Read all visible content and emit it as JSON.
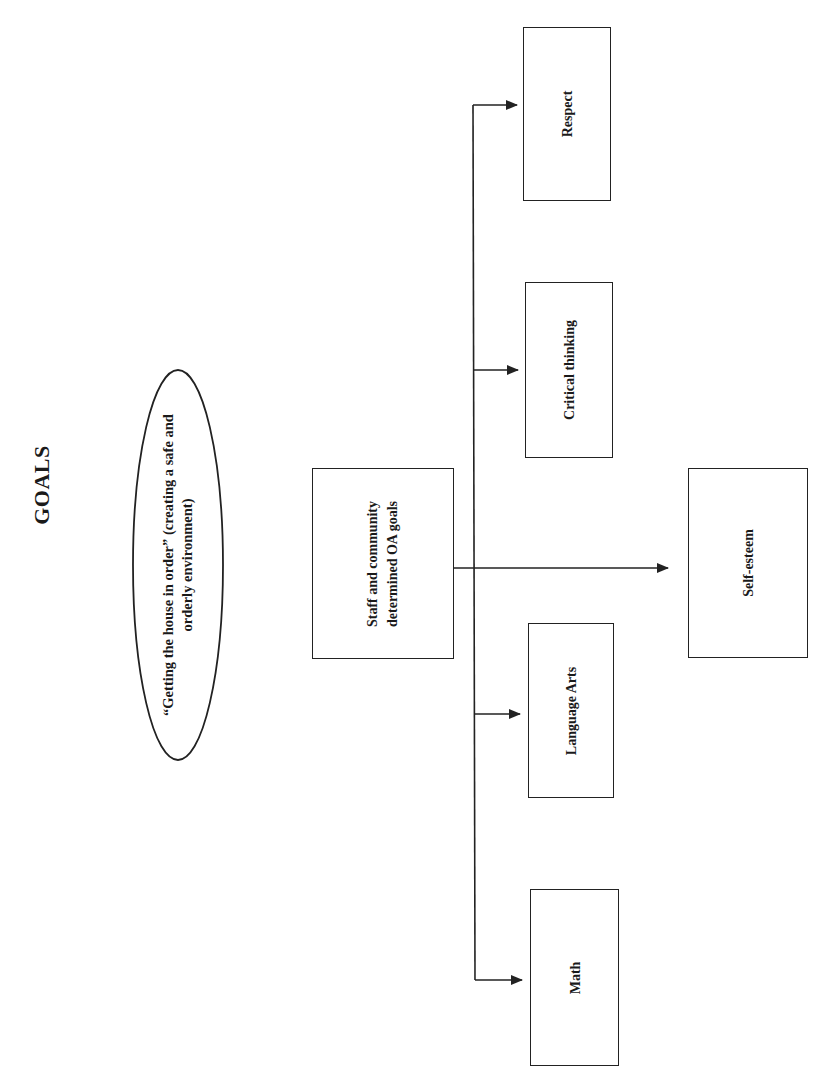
{
  "title": "GOALS",
  "ellipse": {
    "text": "“Getting the house in order” (creating a safe and orderly environment)"
  },
  "central_box": {
    "text": "Staff and community determined OA goals"
  },
  "goals": [
    {
      "id": "respect",
      "label": "Respect"
    },
    {
      "id": "critical-thinking",
      "label": "Critical thinking"
    },
    {
      "id": "self-esteem",
      "label": "Self-esteem"
    },
    {
      "id": "language-arts",
      "label": "Language Arts"
    },
    {
      "id": "math",
      "label": "Math"
    }
  ],
  "colors": {
    "stroke": "#222222",
    "background": "#ffffff",
    "text": "#1a1a1a"
  },
  "orientation": "rotated -90deg (landscape page printed in portrait)"
}
